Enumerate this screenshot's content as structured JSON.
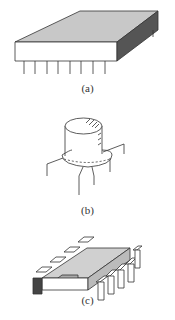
{
  "figure": {
    "panels": [
      {
        "id": "a",
        "caption": "(a)",
        "subject": "flat package integrated circuit with side leads"
      },
      {
        "id": "b",
        "caption": "(b)",
        "subject": "TO-style metal can package with radial leads"
      },
      {
        "id": "c",
        "caption": "(c)",
        "subject": "dual in-line package with bent leads"
      }
    ],
    "colors": {
      "top_face": "#c8c8c8",
      "side_dark": "#555555",
      "line": "#333333",
      "background": "#ffffff"
    }
  }
}
